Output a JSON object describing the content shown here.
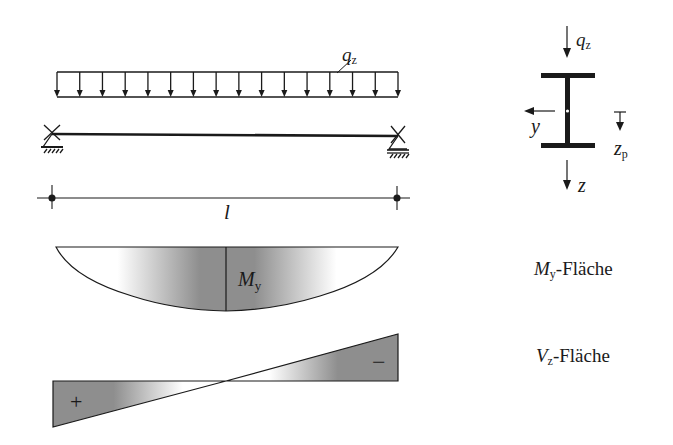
{
  "diagram": {
    "load": {
      "symbol": "q",
      "subscript": "z",
      "arrow_count": 16,
      "x_start": 57,
      "x_end": 398,
      "top_y": 72,
      "bottom_y": 97
    },
    "beam": {
      "x_start": 50,
      "x_end": 398,
      "y": 135,
      "supports": [
        "pinned-left",
        "roller-right"
      ]
    },
    "span": {
      "label": "l"
    },
    "cross_section": {
      "type": "I-section",
      "load_label": "q",
      "load_subscript": "z",
      "y_axis_label": "y",
      "z_axis_label": "z",
      "zp_label": "z",
      "zp_subscript": "p"
    },
    "moment_area": {
      "label_in_plot": "M",
      "label_in_plot_sub": "y",
      "caption_symbol": "M",
      "caption_sub": "y",
      "caption_text": "-Fläche",
      "shape": "parabola",
      "max_at": "midspan"
    },
    "shear_area": {
      "caption_symbol": "V",
      "caption_sub": "z",
      "caption_text": "-Fläche",
      "shape": "linear",
      "zero_at": "midspan",
      "left_sign": "+",
      "right_sign": "−"
    },
    "colors": {
      "line": "#1a1a1a",
      "fill_dark": "#8c8c8c",
      "fill_light": "#ffffff"
    }
  }
}
